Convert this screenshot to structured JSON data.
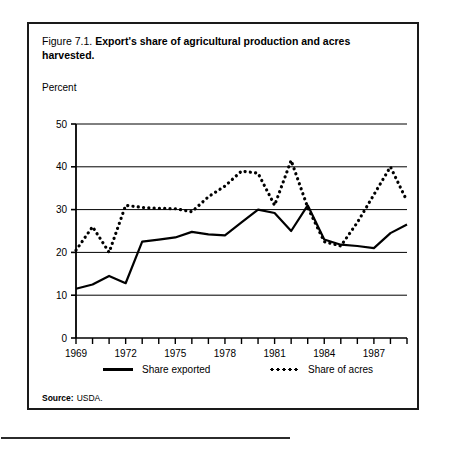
{
  "figure": {
    "number": "Figure 7.1.",
    "title": "Export's share of agricultural production and acres harvested.",
    "unit_label": "Percent",
    "source_label": "Source:",
    "source_value": "USDA."
  },
  "legend": {
    "items": [
      {
        "label": "Share exported",
        "style": "solid"
      },
      {
        "label": "Share of acres",
        "style": "dotted"
      }
    ]
  },
  "chart_data": {
    "type": "line",
    "title": "Export's share of agricultural production and acres harvested.",
    "xlabel": "",
    "ylabel": "Percent",
    "ylim": [
      0,
      50
    ],
    "xlim": [
      1969,
      1989
    ],
    "grid": true,
    "legend_position": "bottom",
    "yticks": [
      0,
      10,
      20,
      30,
      40,
      50
    ],
    "ytick_labels": [
      "0",
      "10",
      "20",
      "30",
      "40",
      "50"
    ],
    "xticks": [
      1969,
      1970,
      1971,
      1972,
      1973,
      1974,
      1975,
      1976,
      1977,
      1978,
      1979,
      1980,
      1981,
      1982,
      1983,
      1984,
      1985,
      1986,
      1987,
      1988,
      1989
    ],
    "xtick_labels": [
      "1969",
      "",
      "",
      "1972",
      "",
      "",
      "1975",
      "",
      "",
      "1978",
      "",
      "",
      "1981",
      "",
      "",
      "1984",
      "",
      "",
      "1987",
      "",
      ""
    ],
    "x": [
      1969,
      1970,
      1971,
      1972,
      1973,
      1974,
      1975,
      1976,
      1977,
      1978,
      1979,
      1980,
      1981,
      1982,
      1983,
      1984,
      1985,
      1986,
      1987,
      1988,
      1989
    ],
    "series": [
      {
        "name": "Share exported",
        "style": "solid",
        "color": "#000000",
        "values": [
          11.5,
          12.5,
          14.5,
          12.8,
          22.5,
          23.0,
          23.5,
          24.8,
          24.2,
          24.0,
          27.0,
          30.0,
          29.2,
          25.0,
          31.0,
          23.0,
          21.8,
          21.5,
          21.0,
          24.5,
          26.5
        ]
      },
      {
        "name": "Share of acres",
        "style": "dotted",
        "color": "#000000",
        "values": [
          20.5,
          26.0,
          20.0,
          31.0,
          30.5,
          30.3,
          30.2,
          29.5,
          33.0,
          35.5,
          39.0,
          38.5,
          31.0,
          41.5,
          30.5,
          22.5,
          21.5,
          27.0,
          33.5,
          40.0,
          32.0
        ]
      }
    ]
  }
}
